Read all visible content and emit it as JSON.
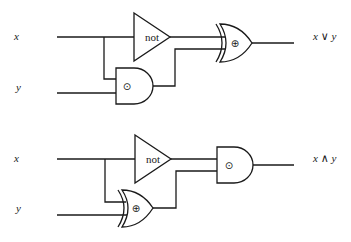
{
  "circuits": [
    {
      "inputs": [
        {
          "label": "x"
        },
        {
          "label": "y"
        }
      ],
      "gates": [
        {
          "type": "not",
          "label": "not"
        },
        {
          "type": "and",
          "symbol": "⊙"
        },
        {
          "type": "xor",
          "symbol": "⊕"
        }
      ],
      "output": {
        "label": "x ∨ y"
      }
    },
    {
      "inputs": [
        {
          "label": "x"
        },
        {
          "label": "y"
        }
      ],
      "gates": [
        {
          "type": "not",
          "label": "not"
        },
        {
          "type": "xor",
          "symbol": "⊕"
        },
        {
          "type": "and",
          "symbol": "⊙"
        }
      ],
      "output": {
        "label": "x ∧ y"
      }
    }
  ]
}
